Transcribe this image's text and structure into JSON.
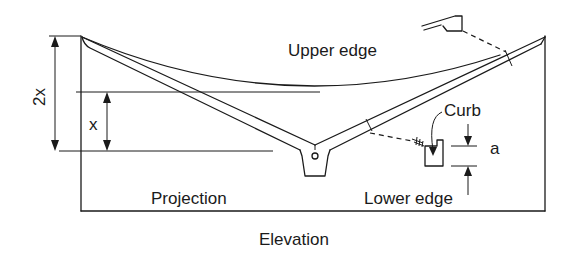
{
  "diagram": {
    "title": "Elevation",
    "labels": {
      "upper_edge": "Upper edge",
      "projection": "Projection",
      "lower_edge": "Lower edge",
      "curb": "Curb",
      "dim_2x": "2x",
      "dim_x": "x",
      "dim_a": "a"
    },
    "stroke_color": "#1a1a1a",
    "background": "#ffffff"
  }
}
